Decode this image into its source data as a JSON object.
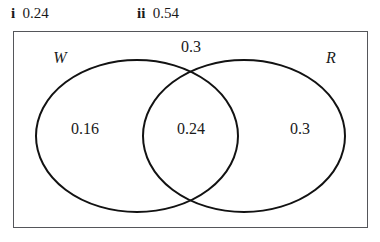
{
  "answers": [
    {
      "label": "i",
      "value": "0.24"
    },
    {
      "label": "ii",
      "value": "0.54"
    }
  ],
  "diagram": {
    "type": "venn-two-set",
    "sets": [
      {
        "id": "left",
        "name": "W"
      },
      {
        "id": "right",
        "name": "R"
      }
    ],
    "regions": [
      {
        "id": "left-only",
        "label": "0.16"
      },
      {
        "id": "intersection",
        "label": "0.24"
      },
      {
        "id": "right-only",
        "label": "0.3"
      },
      {
        "id": "outside",
        "label": "0.3"
      }
    ],
    "colors": {
      "ellipse_stroke": "#121212",
      "rectangle_stroke": "#55565a",
      "background": "#ffffff",
      "text": "#1a1a1a"
    }
  }
}
